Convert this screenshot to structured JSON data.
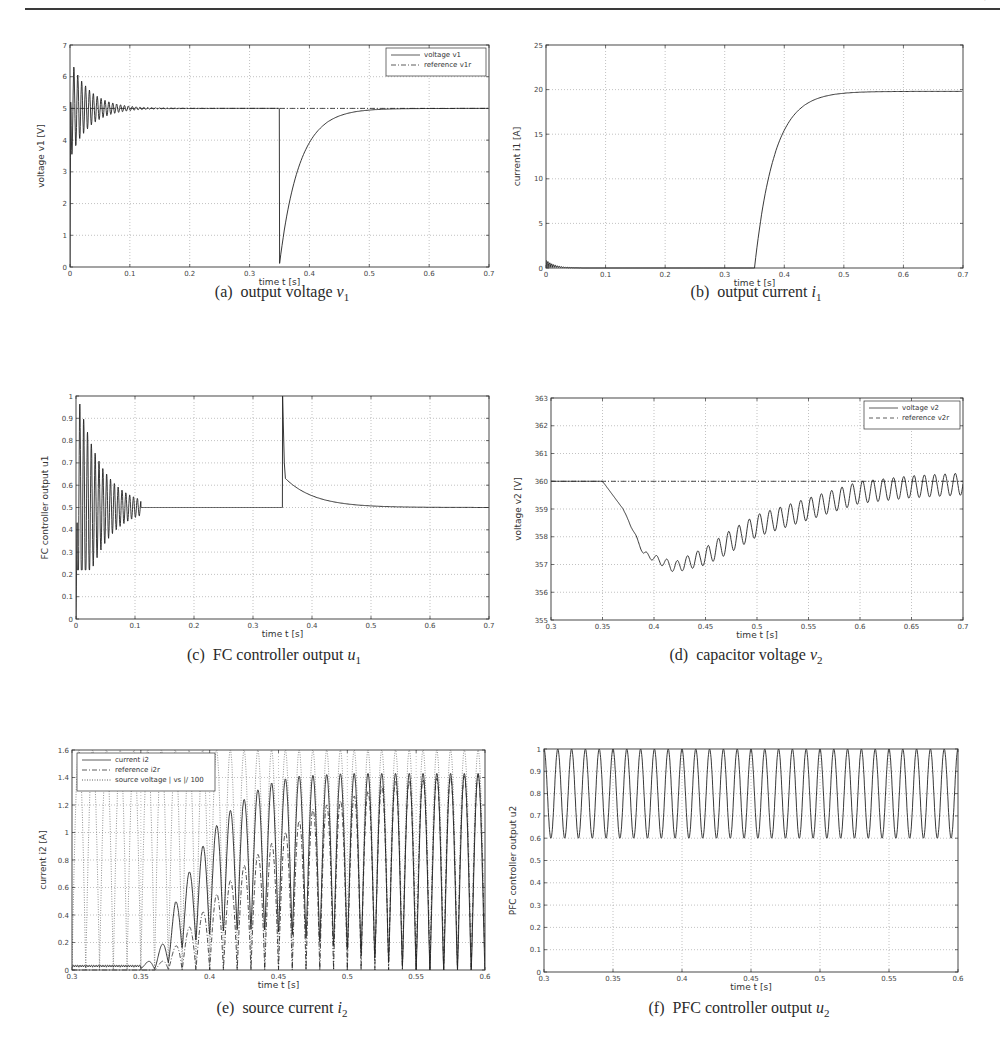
{
  "page": {
    "header_mark": "'"
  },
  "captions": [
    {
      "label": "(a)",
      "text": "output voltage",
      "var": "v",
      "sub": "1"
    },
    {
      "label": "(b)",
      "text": "output current",
      "var": "i",
      "sub": "1"
    },
    {
      "label": "(c)",
      "text": "FC controller output",
      "var": "u",
      "sub": "1"
    },
    {
      "label": "(d)",
      "text": "capacitor voltage",
      "var": "v",
      "sub": "2"
    },
    {
      "label": "(e)",
      "text": "source current",
      "var": "i",
      "sub": "2"
    },
    {
      "label": "(f)",
      "text": "PFC controller output",
      "var": "u",
      "sub": "2"
    }
  ],
  "chart_data": [
    {
      "id": "a",
      "type": "line",
      "title": "(a) output voltage v1",
      "xlabel": "time  t [s]",
      "ylabel": "voltage  v1 [V]",
      "xlim": [
        0,
        0.7
      ],
      "ylim": [
        0,
        7
      ],
      "xticks": [
        0,
        0.1,
        0.2,
        0.3,
        0.4,
        0.5,
        0.6,
        0.7
      ],
      "yticks": [
        0,
        1,
        2,
        3,
        4,
        5,
        6,
        7
      ],
      "grid": true,
      "legend": {
        "position": "upper right",
        "entries": [
          {
            "label": "voltage  v1",
            "style": "solid"
          },
          {
            "label": "reference  v1r",
            "style": "dashdot"
          }
        ]
      },
      "series": [
        {
          "name": "voltage v1",
          "style": "solid",
          "description": "damped oscillation around 5 V from t=0 (peak ~6.5, trough ~3.3) settling by 0.11 s; load step at 0.35 s drops to ~0.1 V then exponential recovery to 5 V by ~0.5 s",
          "x": [
            0,
            0.004,
            0.35,
            0.3501,
            0.36,
            0.38,
            0.4,
            0.45,
            0.5,
            0.7
          ],
          "y": [
            0,
            6.5,
            5.0,
            0.1,
            1.6,
            3.3,
            4.1,
            4.75,
            4.97,
            5.0
          ]
        },
        {
          "name": "reference v1r",
          "style": "dashdot",
          "x": [
            0,
            0.7
          ],
          "y": [
            5,
            5
          ]
        }
      ]
    },
    {
      "id": "b",
      "type": "line",
      "title": "(b) output current i1",
      "xlabel": "time  t [s]",
      "ylabel": "current  i1 [A]",
      "xlim": [
        0,
        0.7
      ],
      "ylim": [
        0,
        25
      ],
      "xticks": [
        0,
        0.1,
        0.2,
        0.3,
        0.4,
        0.5,
        0.6,
        0.7
      ],
      "yticks": [
        0,
        5,
        10,
        15,
        20,
        25
      ],
      "grid": true,
      "series": [
        {
          "name": "current i1",
          "style": "solid",
          "x": [
            0,
            0.002,
            0.05,
            0.35,
            0.36,
            0.37,
            0.38,
            0.39,
            0.4,
            0.42,
            0.45,
            0.5,
            0.7
          ],
          "y": [
            0,
            0.9,
            0.1,
            0,
            5.5,
            9.6,
            12.8,
            15.0,
            16.6,
            18.3,
            19.4,
            19.8,
            19.8
          ]
        }
      ]
    },
    {
      "id": "c",
      "type": "line",
      "title": "(c) FC controller output u1",
      "xlabel": "time  t [s]",
      "ylabel": "FC controller output  u1",
      "xlim": [
        0,
        0.7
      ],
      "ylim": [
        0,
        1
      ],
      "xticks": [
        0,
        0.1,
        0.2,
        0.3,
        0.4,
        0.5,
        0.6,
        0.7
      ],
      "yticks": [
        0,
        0.1,
        0.2,
        0.3,
        0.4,
        0.5,
        0.6,
        0.7,
        0.8,
        0.9,
        1
      ],
      "grid": true,
      "series": [
        {
          "name": "u1",
          "style": "solid",
          "description": "saturating oscillation 0.22-1.0 decaying to 0.5 by 0.11 s; spike to 1 at 0.35 s then decays from ~0.63 to 0.5 by ~0.55 s",
          "x": [
            0,
            0.01,
            0.11,
            0.35,
            0.3501,
            0.355,
            0.37,
            0.4,
            0.45,
            0.5,
            0.55,
            0.7
          ],
          "y": [
            0,
            1.0,
            0.5,
            0.5,
            1.0,
            0.63,
            0.59,
            0.55,
            0.52,
            0.508,
            0.502,
            0.5
          ]
        }
      ]
    },
    {
      "id": "d",
      "type": "line",
      "title": "(d) capacitor voltage v2",
      "xlabel": "time  t [s]",
      "ylabel": "voltage  v2 [V]",
      "xlim": [
        0.3,
        0.7
      ],
      "ylim": [
        355,
        363
      ],
      "xticks": [
        0.3,
        0.35,
        0.4,
        0.45,
        0.5,
        0.55,
        0.6,
        0.65,
        0.7
      ],
      "yticks": [
        355,
        356,
        357,
        358,
        359,
        360,
        361,
        362,
        363
      ],
      "grid": true,
      "legend": {
        "position": "upper right",
        "entries": [
          {
            "label": "voltage  v2",
            "style": "solid"
          },
          {
            "label": "reference  v2r",
            "style": "dashed"
          }
        ]
      },
      "series": [
        {
          "name": "voltage v2",
          "style": "solid",
          "description": "flat 360 until 0.35 s, drops to ~356.7 near 0.42 s, then recovers with 100 Hz ripple (~±0.4 V) toward 360",
          "x": [
            0.3,
            0.35,
            0.37,
            0.39,
            0.42,
            0.45,
            0.5,
            0.55,
            0.6,
            0.65,
            0.7
          ],
          "y": [
            360,
            360,
            359.0,
            357.4,
            356.9,
            357.3,
            358.4,
            359.0,
            359.6,
            359.8,
            359.9
          ]
        },
        {
          "name": "reference v2r",
          "style": "dashdot",
          "x": [
            0.3,
            0.7
          ],
          "y": [
            360,
            360
          ]
        }
      ]
    },
    {
      "id": "e",
      "type": "line",
      "title": "(e) source current i2",
      "xlabel": "time  t [s]",
      "ylabel": "current  i2 [A]",
      "xlim": [
        0.3,
        0.6
      ],
      "ylim": [
        0,
        1.6
      ],
      "xticks": [
        0.3,
        0.35,
        0.4,
        0.45,
        0.5,
        0.55,
        0.6
      ],
      "yticks": [
        0,
        0.2,
        0.4,
        0.6,
        0.8,
        1,
        1.2,
        1.4,
        1.6
      ],
      "grid": true,
      "legend": {
        "position": "upper left",
        "entries": [
          {
            "label": "current  i2",
            "style": "solid"
          },
          {
            "label": "reference  i2r",
            "style": "dashdot"
          },
          {
            "label": "source voltage | vs |/ 100",
            "style": "dotted"
          }
        ]
      },
      "series": [
        {
          "name": "current i2 (peak envelope)",
          "style": "solid",
          "x": [
            0.3,
            0.35,
            0.36,
            0.37,
            0.375,
            0.385,
            0.395,
            0.405,
            0.415,
            0.425,
            0.435,
            0.445,
            0.455,
            0.465,
            0.5,
            0.6
          ],
          "y": [
            0.03,
            0.03,
            0.09,
            0.27,
            0.49,
            0.71,
            0.9,
            1.05,
            1.16,
            1.24,
            1.31,
            1.36,
            1.39,
            1.41,
            1.43,
            1.43
          ]
        },
        {
          "name": "reference i2r (peak envelope)",
          "style": "dashdot",
          "x": [
            0.36,
            0.37,
            0.385,
            0.395,
            0.405,
            0.415,
            0.425,
            0.435,
            0.445,
            0.455,
            0.475,
            0.495,
            0.515,
            0.535,
            0.6
          ],
          "y": [
            0.02,
            0.1,
            0.31,
            0.42,
            0.55,
            0.65,
            0.76,
            0.84,
            0.92,
            1.0,
            1.17,
            1.23,
            1.3,
            1.37,
            1.42
          ]
        },
        {
          "name": "source voltage |vs|/100",
          "style": "dotted",
          "description": "rectified sine, 100 Hz, amplitude ~1.6"
        }
      ]
    },
    {
      "id": "f",
      "type": "line",
      "title": "(f) PFC controller output u2",
      "xlabel": "time  t [s]",
      "ylabel": "PFC controller output  u2",
      "xlim": [
        0.3,
        0.6
      ],
      "ylim": [
        0,
        1
      ],
      "xticks": [
        0.3,
        0.35,
        0.4,
        0.45,
        0.5,
        0.55,
        0.6
      ],
      "yticks": [
        0,
        0.1,
        0.2,
        0.3,
        0.4,
        0.5,
        0.6,
        0.7,
        0.8,
        0.9,
        1
      ],
      "grid": true,
      "series": [
        {
          "name": "u2",
          "style": "solid",
          "description": "periodic 100 Hz oscillation between ~0.6 and 1.0 across whole window",
          "min": 0.6,
          "max": 1.0,
          "frequency_hz": 100
        }
      ]
    }
  ]
}
